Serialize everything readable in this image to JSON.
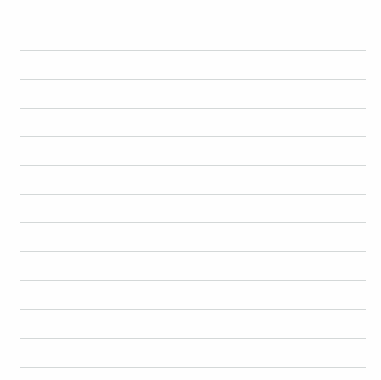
{
  "paper": {
    "type": "lined-paper",
    "line_color": "#d4d8d8",
    "background": "#fefefe",
    "line_count": 12,
    "lines_y": [
      50,
      79,
      108,
      136,
      165,
      194,
      222,
      251,
      280,
      309,
      338,
      367
    ]
  }
}
